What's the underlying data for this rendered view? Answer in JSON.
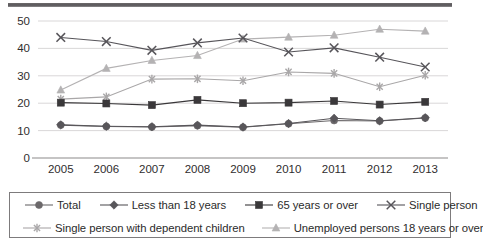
{
  "chart_data": {
    "type": "line",
    "title": "",
    "xlabel": "",
    "ylabel": "",
    "categories": [
      "2005",
      "2006",
      "2007",
      "2008",
      "2009",
      "2010",
      "2011",
      "2012",
      "2013"
    ],
    "ylim": [
      0,
      50
    ],
    "yticks": [
      0,
      10,
      20,
      30,
      40,
      50
    ],
    "grid": true,
    "legend_position": "bottom",
    "series": [
      {
        "name": "Total",
        "marker": "circle",
        "color": "#6b686a",
        "values": [
          12.0,
          11.5,
          11.3,
          11.8,
          11.2,
          12.5,
          13.7,
          13.5,
          14.6
        ]
      },
      {
        "name": "Less than 18 years",
        "marker": "diamond",
        "color": "#58565a",
        "values": [
          12.1,
          11.6,
          11.4,
          12.0,
          11.3,
          12.6,
          14.5,
          13.6,
          14.7
        ]
      },
      {
        "name": "65 years or over",
        "marker": "square",
        "color": "#3a383a",
        "values": [
          20.2,
          19.9,
          19.3,
          21.2,
          20.0,
          20.2,
          20.8,
          19.5,
          20.5
        ]
      },
      {
        "name": "Single person",
        "marker": "cross",
        "color": "#57555a",
        "values": [
          44.0,
          42.5,
          39.3,
          42.0,
          43.8,
          38.7,
          40.2,
          36.8,
          33.2
        ]
      },
      {
        "name": "Single person with dependent children",
        "marker": "asterisk",
        "color": "#a9a7a8",
        "values": [
          21.5,
          22.3,
          28.8,
          28.9,
          28.2,
          31.4,
          30.9,
          26.0,
          30.2
        ]
      },
      {
        "name": "Unemployed persons 18 years or over",
        "marker": "triangle",
        "color": "#b4b2b3",
        "values": [
          24.8,
          32.7,
          35.6,
          37.4,
          43.4,
          44.1,
          44.8,
          47.0,
          46.3
        ]
      }
    ]
  },
  "axis": {
    "y_tick_labels": [
      "0",
      "10",
      "20",
      "30",
      "40",
      "50"
    ],
    "x_tick_labels": [
      "2005",
      "2006",
      "2007",
      "2008",
      "2009",
      "2010",
      "2011",
      "2012",
      "2013"
    ]
  },
  "legend": {
    "row1": [
      {
        "label": "Total",
        "marker": "circle",
        "color": "#6b686a"
      },
      {
        "label": "Less than 18 years",
        "marker": "diamond",
        "color": "#58565a"
      },
      {
        "label": "65 years or over",
        "marker": "square",
        "color": "#3a383a"
      },
      {
        "label": "Single person",
        "marker": "cross",
        "color": "#57555a"
      }
    ],
    "row2": [
      {
        "label": "Single person with dependent children",
        "marker": "asterisk",
        "color": "#a9a7a8"
      },
      {
        "label": "Unemployed persons 18 years or over",
        "marker": "triangle",
        "color": "#b4b2b3"
      }
    ]
  }
}
